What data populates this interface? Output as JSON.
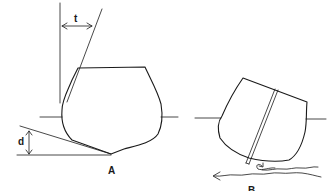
{
  "figure": {
    "panels": [
      {
        "id": "A",
        "label": "A",
        "description": "Hull cross-section upright with flare angle and deadrise",
        "annotations": [
          {
            "symbol": "t",
            "meaning": "horizontal offset between vertical reference and flare line"
          },
          {
            "symbol": "d",
            "meaning": "deadrise height between bottom tangent and baseline"
          }
        ]
      },
      {
        "id": "B",
        "label": "B",
        "description": "Hull cross-section heeled with centerboard and water flow arrows"
      }
    ],
    "colors": {
      "line": "#1a1a1a",
      "background": "#ffffff"
    }
  }
}
